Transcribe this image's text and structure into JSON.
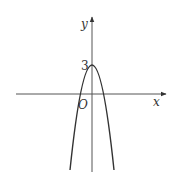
{
  "figure": {
    "type": "function-graph",
    "axes": {
      "x_label": "x",
      "y_label": "y",
      "origin_label": "O"
    },
    "curve": {
      "kind": "downward parabola",
      "vertex_label": "3"
    },
    "colors": {
      "axis": "#555555",
      "curve": "#333333",
      "text": "#333333"
    }
  }
}
